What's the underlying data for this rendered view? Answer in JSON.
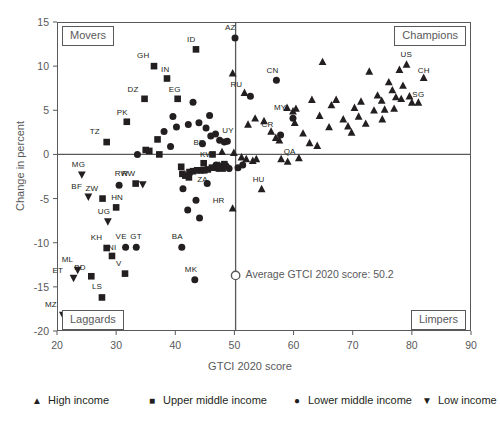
{
  "chart_data": {
    "type": "scatter",
    "title": "",
    "xlabel": "GTCI 2020 score",
    "ylabel": "Change in percent",
    "xlim": [
      20,
      90
    ],
    "ylim": [
      -20,
      15
    ],
    "xticks": [
      20,
      30,
      40,
      50,
      60,
      70,
      80,
      90
    ],
    "yticks": [
      15,
      10,
      5,
      0,
      -5,
      -10,
      -15,
      -20
    ],
    "grid": false,
    "reference_lines": [
      {
        "name": "zero-change-line",
        "axis": "y",
        "value": 0
      },
      {
        "name": "average-score-line",
        "axis": "x",
        "value": 50.2
      }
    ],
    "annotation": {
      "text": "Average GTCI 2020 score: 50.2",
      "marker": "open-circle",
      "x": 50.2,
      "y": -13.7
    },
    "quadrants": [
      {
        "name": "movers",
        "label": "Movers",
        "corner": "top-left"
      },
      {
        "name": "champions",
        "label": "Champions",
        "corner": "top-right"
      },
      {
        "name": "laggards",
        "label": "Laggards",
        "corner": "bottom-left"
      },
      {
        "name": "limpers",
        "label": "Limpers",
        "corner": "bottom-right"
      }
    ],
    "legend": {
      "position": "bottom",
      "entries": [
        {
          "marker": "triangle-up",
          "label": "High income"
        },
        {
          "marker": "square",
          "label": "Upper middle income"
        },
        {
          "marker": "circle",
          "label": "Lower middle income"
        },
        {
          "marker": "triangle-down",
          "label": "Low income"
        }
      ]
    },
    "series": [
      {
        "name": "High income",
        "marker": "triangle-up",
        "points": [
          {
            "label": "CH",
            "x": 82.0,
            "y": 8.7
          },
          {
            "label": "US",
            "x": 79.1,
            "y": 10.2
          },
          {
            "label": "SG",
            "x": 81.1,
            "y": 5.9
          },
          {
            "label": "QA",
            "x": 59.0,
            "y": -0.8
          },
          {
            "label": "HU",
            "x": 54.6,
            "y": -3.9
          },
          {
            "label": "HR",
            "x": 49.7,
            "y": -6.1
          },
          {
            "label": "KW",
            "x": 47.4,
            "y": -1.2
          },
          {
            "label": "",
            "x": 49.9,
            "y": 0.2
          },
          {
            "label": "",
            "x": 49.7,
            "y": 9.2
          },
          {
            "label": "",
            "x": 51.2,
            "y": -0.3
          },
          {
            "label": "",
            "x": 52.0,
            "y": -0.5
          },
          {
            "label": "",
            "x": 53.1,
            "y": -0.7
          },
          {
            "label": "",
            "x": 53.7,
            "y": -0.5
          },
          {
            "label": "",
            "x": 52.3,
            "y": 3.4
          },
          {
            "label": "",
            "x": 53.5,
            "y": 4.1
          },
          {
            "label": "",
            "x": 55.0,
            "y": 3.8
          },
          {
            "label": "",
            "x": 56.2,
            "y": 2.6
          },
          {
            "label": "",
            "x": 57.0,
            "y": 1.9
          },
          {
            "label": "",
            "x": 57.6,
            "y": 1.6
          },
          {
            "label": "",
            "x": 58.9,
            "y": 5.3
          },
          {
            "label": "",
            "x": 59.9,
            "y": 4.9
          },
          {
            "label": "",
            "x": 60.4,
            "y": 5.2
          },
          {
            "label": "",
            "x": 60.2,
            "y": 3.6
          },
          {
            "label": "",
            "x": 61.6,
            "y": 2.4
          },
          {
            "label": "",
            "x": 62.7,
            "y": 1.3
          },
          {
            "label": "",
            "x": 63.1,
            "y": 6.2
          },
          {
            "label": "",
            "x": 64.4,
            "y": 4.4
          },
          {
            "label": "",
            "x": 64.0,
            "y": 1.0
          },
          {
            "label": "",
            "x": 64.9,
            "y": 10.5
          },
          {
            "label": "",
            "x": 66.4,
            "y": 5.6
          },
          {
            "label": "",
            "x": 66.0,
            "y": 3.1
          },
          {
            "label": "",
            "x": 67.2,
            "y": 6.2
          },
          {
            "label": "",
            "x": 68.4,
            "y": 4.0
          },
          {
            "label": "",
            "x": 69.2,
            "y": 3.2
          },
          {
            "label": "",
            "x": 69.8,
            "y": 2.5
          },
          {
            "label": "",
            "x": 70.3,
            "y": 5.3
          },
          {
            "label": "",
            "x": 71.0,
            "y": 4.3
          },
          {
            "label": "",
            "x": 71.4,
            "y": 6.0
          },
          {
            "label": "",
            "x": 72.2,
            "y": 3.5
          },
          {
            "label": "",
            "x": 72.8,
            "y": 9.4
          },
          {
            "label": "",
            "x": 73.6,
            "y": 5.0
          },
          {
            "label": "",
            "x": 74.2,
            "y": 6.7
          },
          {
            "label": "",
            "x": 74.9,
            "y": 6.1
          },
          {
            "label": "",
            "x": 75.4,
            "y": 5.1
          },
          {
            "label": "",
            "x": 75.0,
            "y": 4.0
          },
          {
            "label": "",
            "x": 76.1,
            "y": 8.2
          },
          {
            "label": "",
            "x": 76.7,
            "y": 7.3
          },
          {
            "label": "",
            "x": 77.3,
            "y": 6.5
          },
          {
            "label": "",
            "x": 77.0,
            "y": 5.2
          },
          {
            "label": "",
            "x": 77.9,
            "y": 9.6
          },
          {
            "label": "",
            "x": 78.5,
            "y": 7.8
          },
          {
            "label": "",
            "x": 78.2,
            "y": 6.3
          },
          {
            "label": "",
            "x": 79.6,
            "y": 6.6
          },
          {
            "label": "",
            "x": 80.0,
            "y": 5.9
          },
          {
            "label": "",
            "x": 60.9,
            "y": -0.4
          },
          {
            "label": "",
            "x": 57.9,
            "y": -0.5
          },
          {
            "label": "",
            "x": 47.9,
            "y": 0.3
          },
          {
            "label": "",
            "x": 51.7,
            "y": 7.0
          }
        ]
      },
      {
        "name": "Upper middle income",
        "marker": "square",
        "points": [
          {
            "label": "ID",
            "x": 43.5,
            "y": 11.9
          },
          {
            "label": "GH",
            "x": 36.4,
            "y": 10.0
          },
          {
            "label": "IN",
            "x": 38.6,
            "y": 8.6
          },
          {
            "label": "DZ",
            "x": 34.8,
            "y": 6.3
          },
          {
            "label": "EG",
            "x": 40.4,
            "y": 6.3
          },
          {
            "label": "PK",
            "x": 31.8,
            "y": 3.7
          },
          {
            "label": "TZ",
            "x": 28.4,
            "y": 1.4
          },
          {
            "label": "BR",
            "x": 46.3,
            "y": 0.0
          },
          {
            "label": "BD",
            "x": 25.8,
            "y": -13.8
          },
          {
            "label": "LS",
            "x": 27.6,
            "y": -16.2
          },
          {
            "label": "NI",
            "x": 29.3,
            "y": -11.5
          },
          {
            "label": "KH",
            "x": 28.4,
            "y": -10.6
          },
          {
            "label": "V",
            "x": 31.5,
            "y": -13.5
          },
          {
            "label": "ZW",
            "x": 27.7,
            "y": -5.0
          },
          {
            "label": "HN",
            "x": 30.0,
            "y": -6.0
          },
          {
            "label": "RW",
            "x": 33.3,
            "y": -3.3
          },
          {
            "label": "",
            "x": 37.0,
            "y": 1.7
          },
          {
            "label": "",
            "x": 37.3,
            "y": 0.0
          },
          {
            "label": "",
            "x": 35.0,
            "y": 0.5
          },
          {
            "label": "",
            "x": 35.6,
            "y": 0.4
          },
          {
            "label": "",
            "x": 41.2,
            "y": -2.2
          },
          {
            "label": "",
            "x": 41.7,
            "y": -2.4
          },
          {
            "label": "",
            "x": 42.4,
            "y": -2.0
          },
          {
            "label": "",
            "x": 43.0,
            "y": -1.9
          },
          {
            "label": "",
            "x": 43.7,
            "y": -1.8
          },
          {
            "label": "",
            "x": 44.3,
            "y": -1.8
          },
          {
            "label": "",
            "x": 44.9,
            "y": -1.8
          },
          {
            "label": "",
            "x": 45.5,
            "y": -1.7
          },
          {
            "label": "",
            "x": 46.2,
            "y": -1.5
          },
          {
            "label": "",
            "x": 42.3,
            "y": -2.6
          },
          {
            "label": "",
            "x": 41.0,
            "y": -1.4
          },
          {
            "label": "",
            "x": 47.6,
            "y": -1.3
          },
          {
            "label": "",
            "x": 48.3,
            "y": -1.1
          },
          {
            "label": "",
            "x": 48.0,
            "y": -1.6
          },
          {
            "label": "",
            "x": 44.8,
            "y": -1.0
          }
        ]
      },
      {
        "name": "Lower middle income",
        "marker": "circle",
        "points": [
          {
            "label": "AZ",
            "x": 50.1,
            "y": 13.2
          },
          {
            "label": "CN",
            "x": 57.1,
            "y": 8.4
          },
          {
            "label": "RU",
            "x": 52.7,
            "y": 6.6
          },
          {
            "label": "MY",
            "x": 59.9,
            "y": 4.1
          },
          {
            "label": "CR",
            "x": 57.8,
            "y": 2.2
          },
          {
            "label": "UY",
            "x": 48.8,
            "y": 1.5
          },
          {
            "label": "ZA",
            "x": 45.4,
            "y": -3.3
          },
          {
            "label": "BA",
            "x": 41.1,
            "y": -10.5
          },
          {
            "label": "MK",
            "x": 43.3,
            "y": -14.2
          },
          {
            "label": "VE",
            "x": 31.6,
            "y": -10.5
          },
          {
            "label": "GT",
            "x": 33.4,
            "y": -10.5
          },
          {
            "label": "",
            "x": 43.0,
            "y": 5.9
          },
          {
            "label": "",
            "x": 42.2,
            "y": 3.4
          },
          {
            "label": "",
            "x": 44.0,
            "y": 3.6
          },
          {
            "label": "",
            "x": 45.2,
            "y": 3.0
          },
          {
            "label": "",
            "x": 46.0,
            "y": 2.1
          },
          {
            "label": "",
            "x": 46.8,
            "y": 2.3
          },
          {
            "label": "",
            "x": 47.5,
            "y": 1.6
          },
          {
            "label": "",
            "x": 48.3,
            "y": 1.4
          },
          {
            "label": "",
            "x": 44.6,
            "y": 1.2
          },
          {
            "label": "",
            "x": 39.2,
            "y": 0.9
          },
          {
            "label": "",
            "x": 33.6,
            "y": 0.0
          },
          {
            "label": "",
            "x": 41.3,
            "y": -3.9
          },
          {
            "label": "",
            "x": 42.1,
            "y": -6.3
          },
          {
            "label": "",
            "x": 43.5,
            "y": -5.2
          },
          {
            "label": "",
            "x": 44.1,
            "y": -7.2
          },
          {
            "label": "",
            "x": 46.9,
            "y": -1.2
          },
          {
            "label": "",
            "x": 47.2,
            "y": -1.6
          },
          {
            "label": "",
            "x": 48.6,
            "y": -1.3
          },
          {
            "label": "",
            "x": 49.1,
            "y": -1.6
          },
          {
            "label": "",
            "x": 50.6,
            "y": -1.5
          },
          {
            "label": "",
            "x": 51.4,
            "y": -1.2
          },
          {
            "label": "",
            "x": 38.1,
            "y": 2.6
          },
          {
            "label": "",
            "x": 40.2,
            "y": 3.1
          },
          {
            "label": "",
            "x": 30.5,
            "y": -3.5
          },
          {
            "label": "",
            "x": 39.6,
            "y": 4.3
          },
          {
            "label": "",
            "x": 45.8,
            "y": 4.4
          }
        ]
      },
      {
        "name": "Low income",
        "marker": "triangle-down",
        "points": [
          {
            "label": "MG",
            "x": 24.2,
            "y": -2.3
          },
          {
            "label": "BF",
            "x": 25.3,
            "y": -4.8
          },
          {
            "label": "UG",
            "x": 28.6,
            "y": -7.6
          },
          {
            "label": "ML",
            "x": 23.5,
            "y": -13.1
          },
          {
            "label": "ET",
            "x": 22.8,
            "y": -14.0
          },
          {
            "label": "MZ",
            "x": 21.0,
            "y": -18.2
          },
          {
            "label": "RW",
            "x": 34.5,
            "y": -3.4
          }
        ]
      }
    ]
  },
  "ticks": {
    "x": [
      "20",
      "30",
      "40",
      "50",
      "60",
      "70",
      "80",
      "90"
    ],
    "y": [
      "15",
      "10",
      "5",
      "0",
      "-5",
      "-10",
      "-15",
      "-20"
    ]
  },
  "axes": {
    "x_title": "GTCI 2020 score",
    "y_title": "Change in percent"
  },
  "quadrant_labels": {
    "movers": "Movers",
    "champions": "Champions",
    "laggards": "Laggards",
    "limpers": "Limpers"
  },
  "annotation_text": "Average GTCI 2020 score: 50.2",
  "legend_labels": {
    "high": "High income",
    "upper_middle": "Upper middle income",
    "lower_middle": "Lower middle income",
    "low": "Low income"
  },
  "glyphs": {
    "triangle_up": "▲",
    "square": "■",
    "circle": "●",
    "triangle_down": "▼"
  },
  "colors": {
    "marker": "#231f20",
    "frame": "#58595b",
    "text": "#58595b"
  }
}
